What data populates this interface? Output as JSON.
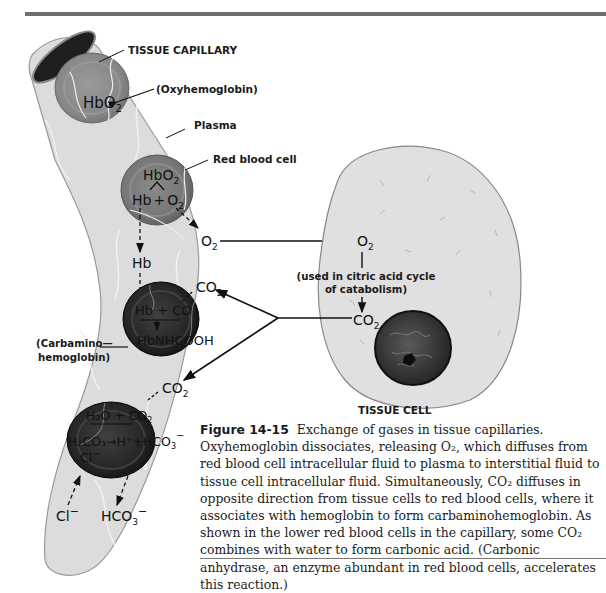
{
  "figure": {
    "number": "Figure 14-15",
    "caption": "Exchange of gases in tissue capillaries. Oxyhemoglobin dissociates, releasing O₂, which diffuses from red blood cell intracellular fluid to plasma to interstitial fluid to tissue cell intracellular fluid. Simultaneously, CO₂ diffuses in opposite direction from tissue cells to red blood cells, where it associates with hemoglobin to form carbaminohemoglobin. As shown in the lower red blood cells in the capillary, some CO₂ combines with water to form carbonic acid. (Carbonic anhydrase, an enzyme abundant in red blood cells, accelerates this reaction.)"
  },
  "labels": {
    "tissue_capillary": "TISSUE CAPILLARY",
    "oxyhemoglobin": "(Oxyhemoglobin)",
    "plasma": "Plasma",
    "red_blood_cell": "Red blood cell",
    "carbamino_line1": "(Carbamino—",
    "carbamino_line2": "hemoglobin)",
    "tissue_cell": "TISSUE CELL",
    "citric_line1": "(used in citric acid cycle",
    "citric_line2": "of catabolism)"
  },
  "chemistry": {
    "hbo2": "HbO",
    "sub2": "2",
    "hb_plus_o2_hb": "Hb",
    "plus": "+",
    "o2": "O",
    "hb": "Hb",
    "co2": "CO",
    "hb_plus_co2": "Hb + CO",
    "hbnhcooh": "HbNHCOOH",
    "h2o_plus_co2": "H₂O + CO",
    "carbonic": "H₂CO₃→H⁺+HCO",
    "sub3": "3",
    "minus": "−",
    "cl": "Cl",
    "hco3": "HCO"
  },
  "colors": {
    "capillary_wall": "#d9d9d9",
    "rbc_oxy": "#8c8c8c",
    "rbc_dark": "#2a2a2a",
    "tissue_cell_fill": "#dedede",
    "nucleus": "#3a3a3a"
  }
}
